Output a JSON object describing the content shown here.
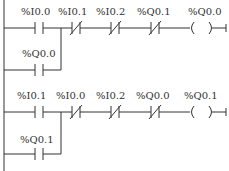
{
  "rungs": [
    {
      "main_contacts": [
        {
          "label": "%I0.0",
          "type": "NO"
        },
        {
          "label": "%I0.1",
          "type": "NC"
        },
        {
          "label": "%I0.2",
          "type": "NC"
        },
        {
          "label": "%Q0.1",
          "type": "NC"
        }
      ],
      "branch_contact": {
        "label": "%Q0.0",
        "type": "NO"
      },
      "coil": {
        "label": "%Q0.0"
      }
    },
    {
      "main_contacts": [
        {
          "label": "%I0.1",
          "type": "NO"
        },
        {
          "label": "%I0.0",
          "type": "NC"
        },
        {
          "label": "%I0.2",
          "type": "NC"
        },
        {
          "label": "%Q0.0",
          "type": "NC"
        }
      ],
      "branch_contact": {
        "label": "%Q0.1",
        "type": "NO"
      },
      "coil": {
        "label": "%Q0.1"
      }
    }
  ]
}
